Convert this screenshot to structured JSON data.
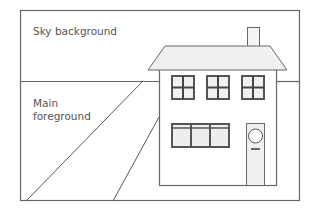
{
  "diagram": {
    "labels": {
      "sky": "Sky background",
      "foreground": "Main\nforeground"
    },
    "colors": {
      "stroke": "#555555",
      "fill_light": "#f0f0f0",
      "window_frame": "#555555",
      "background": "#ffffff"
    },
    "elements": [
      "frame",
      "horizon-line",
      "path-lines",
      "house",
      "roof",
      "chimney",
      "upper-windows",
      "lower-window",
      "door"
    ]
  }
}
